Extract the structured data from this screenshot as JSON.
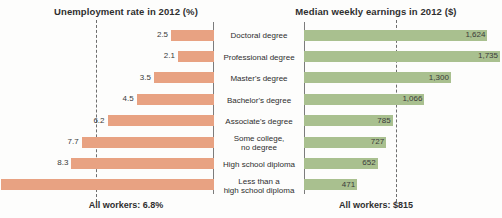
{
  "chart_data": {
    "type": "bar",
    "orientation": "horizontal",
    "layout": "back-to-back paired bar chart with shared centered category labels",
    "categories": [
      "Doctoral degree",
      "Professional degree",
      "Master's degree",
      "Bachelor's degree",
      "Associate's degree",
      "Some college,\nno degree",
      "High school diploma",
      "Less than a\nhigh school diploma"
    ],
    "panels": [
      {
        "key": "unemployment",
        "title": "Unemployment rate in 2012 (%)",
        "side": "left",
        "direction": "rtl",
        "color": "#e8a282",
        "xlabel": "",
        "ylabel": "",
        "xlim": [
          0,
          12.4
        ],
        "grid": false,
        "values": [
          2.5,
          2.1,
          3.5,
          4.5,
          6.2,
          7.7,
          8.3,
          12.4
        ],
        "value_labels": [
          "2.5",
          "2.1",
          "3.5",
          "4.5",
          "6.2",
          "7.7",
          "8.3",
          "12.4"
        ],
        "reference_line": {
          "value": 6.8,
          "style": "dashed",
          "color": "#6e6e6e",
          "label": "All workers: 6.8%"
        }
      },
      {
        "key": "earnings",
        "title": "Median weekly earnings in 2012 ($)",
        "side": "right",
        "direction": "ltr",
        "color": "#a9c08f",
        "xlabel": "",
        "ylabel": "",
        "xlim": [
          0,
          1735
        ],
        "grid": false,
        "values": [
          1624,
          1735,
          1300,
          1066,
          785,
          727,
          652,
          471
        ],
        "value_labels": [
          "1,624",
          "1,735",
          "1,300",
          "1,066",
          "785",
          "727",
          "652",
          "471"
        ],
        "reference_line": {
          "value": 815,
          "style": "dashed",
          "color": "#6e6e6e",
          "label": "All workers: $815"
        }
      }
    ],
    "legend": null,
    "legend_position": "none",
    "colors": {
      "unemployment_bar": "#e8a282",
      "earnings_bar": "#a9c08f",
      "axis_spine": "#7c7c7c",
      "reference_line": "#6e6e6e",
      "text": "#2f2f2f",
      "background": "#fdfdfc"
    }
  },
  "left_panel": {
    "title": "Unemployment rate in 2012 (%)",
    "footer": "All workers: 6.8%"
  },
  "right_panel": {
    "title": "Median weekly earnings in 2012 ($)",
    "footer": "All workers: $815"
  }
}
